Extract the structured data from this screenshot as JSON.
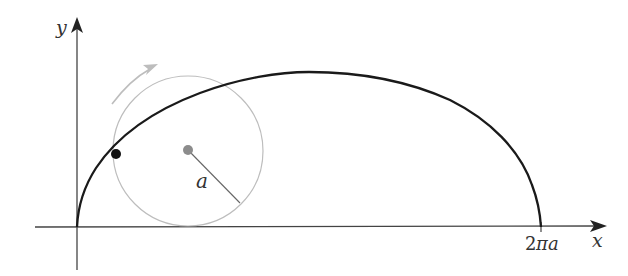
{
  "figure": {
    "type": "cycloid-diagram",
    "axes": {
      "x_label": "x",
      "y_label": "y",
      "x_tick_label_number": "2",
      "x_tick_label_pi": "π",
      "x_tick_label_a": "a"
    },
    "circle": {
      "radius_label": "a"
    },
    "colors": {
      "curve": "#1a1a1a",
      "axis": "#333333",
      "circle": "#b8b8b8",
      "rotation_arrow": "#b8b8b8",
      "center_dot": "#8a8a8a",
      "point": "#111111"
    }
  }
}
